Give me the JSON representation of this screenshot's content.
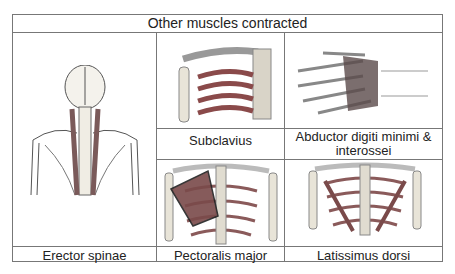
{
  "title": "Other muscles contracted",
  "cells": {
    "erector": {
      "label": "Erector spinae",
      "icon": "back-spine-skeleton-icon"
    },
    "subclavius": {
      "label": "Subclavius",
      "icon": "shoulder-clavicle-icon"
    },
    "abductor": {
      "label": "Abductor digiti minimi & interossei",
      "line1": "Abductor digiti minimi &",
      "line2": "interossei",
      "icon": "hand-muscles-icon"
    },
    "pectoralis": {
      "label": "Pectoralis major",
      "icon": "chest-ribcage-icon"
    },
    "latissimus": {
      "label": "Latissimus dorsi",
      "icon": "back-ribcage-icon"
    }
  },
  "colors": {
    "muscle": "#8a4a4a",
    "bone": "#e8e4d8",
    "line": "#777777"
  }
}
